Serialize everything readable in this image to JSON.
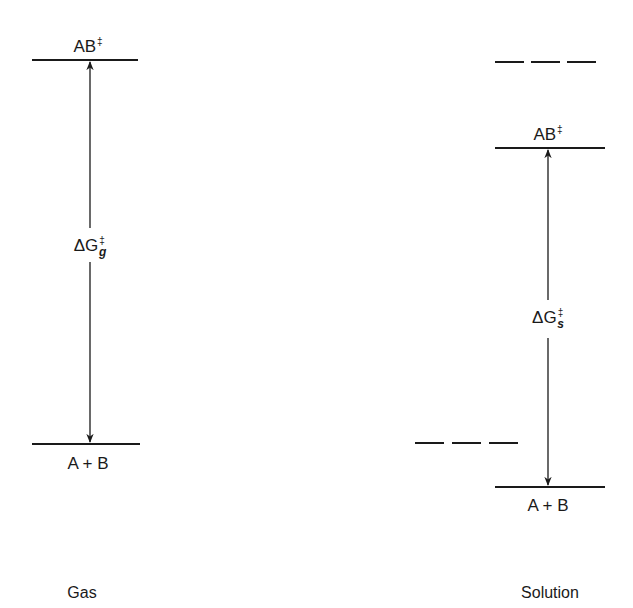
{
  "diagram": {
    "type": "energy-level-diagram",
    "line_color": "#1a1a1a",
    "panels": [
      {
        "name": "Gas",
        "caption": "Gas",
        "upper_level": {
          "label_base": "AB",
          "label_sup": "‡",
          "style": "solid"
        },
        "lower_level": {
          "label": "A + B",
          "style": "solid"
        },
        "arrow": {
          "label_base": "ΔG",
          "label_sup": "‡",
          "label_sub": "g",
          "direction": "double"
        }
      },
      {
        "name": "Solution",
        "caption": "Solution",
        "reference_upper_dashed": {
          "style": "dashed"
        },
        "upper_level": {
          "label_base": "AB",
          "label_sup": "‡",
          "style": "solid"
        },
        "reference_lower_dashed": {
          "style": "dashed"
        },
        "lower_level": {
          "label": "A + B",
          "style": "solid"
        },
        "arrow": {
          "label_base": "ΔG",
          "label_sup": "‡",
          "label_sub": "s",
          "direction": "double"
        }
      }
    ]
  }
}
